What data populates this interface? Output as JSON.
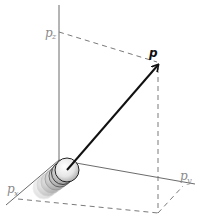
{
  "diagram": {
    "labels": {
      "vector": "p",
      "pz_base": "p",
      "pz_sub": "z",
      "px_base": "p",
      "px_sub": "x",
      "py_base": "p",
      "py_sub": "y"
    },
    "colors": {
      "axis": "#6b6b6b",
      "dashed": "#7a7a7a",
      "vector": "#111111",
      "label": "#8a8a8a",
      "sphere_light": "#ffffff",
      "sphere_dark": "#bdbdbd"
    },
    "geometry": {
      "origin": [
        59,
        160
      ],
      "z_axis_top": [
        59,
        5
      ],
      "x_axis_end": [
        6,
        205
      ],
      "y_axis_end": [
        195,
        184
      ],
      "vector_tip": [
        159,
        64
      ],
      "pz_point": [
        59,
        32
      ],
      "floor_corner": [
        158,
        213
      ],
      "sphere_center": [
        67,
        170
      ],
      "sphere_radius": 12
    }
  }
}
